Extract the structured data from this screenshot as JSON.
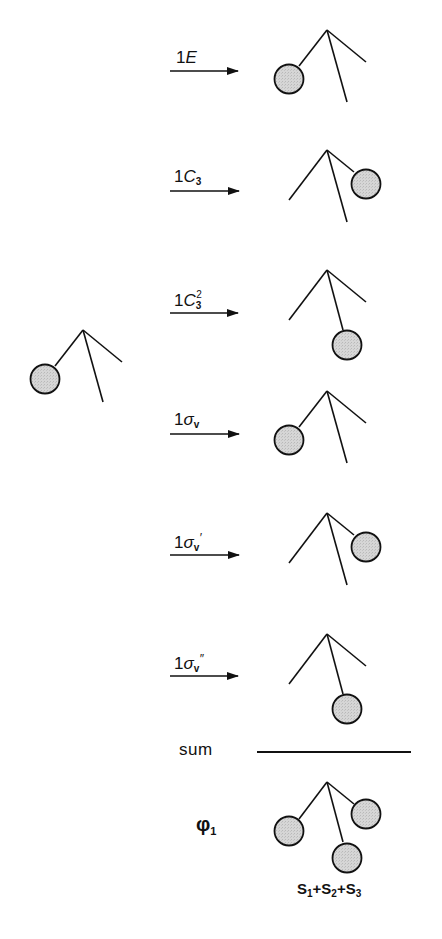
{
  "diagram": {
    "type": "symmetry-projection-operator",
    "colors": {
      "line": "#111111",
      "orbital_fill": "#d2d2d2",
      "background": "#ffffff"
    },
    "start_figure": {
      "label": "",
      "orbital_position": "left"
    },
    "operations": [
      {
        "coefficient": "1",
        "symbol": "E",
        "subscript": "",
        "superscript": "",
        "prime": "",
        "result_orbital_position": "left"
      },
      {
        "coefficient": "1",
        "symbol": "C",
        "subscript": "3",
        "superscript": "",
        "prime": "",
        "result_orbital_position": "right"
      },
      {
        "coefficient": "1",
        "symbol": "C",
        "subscript": "3",
        "superscript": "2",
        "prime": "",
        "result_orbital_position": "bottom"
      },
      {
        "coefficient": "1",
        "symbol": "σ",
        "subscript": "v",
        "superscript": "",
        "prime": "",
        "result_orbital_position": "left"
      },
      {
        "coefficient": "1",
        "symbol": "σ",
        "subscript": "v",
        "superscript": "",
        "prime": "′",
        "result_orbital_position": "right"
      },
      {
        "coefficient": "1",
        "symbol": "σ",
        "subscript": "v",
        "superscript": "",
        "prime": "″",
        "result_orbital_position": "bottom"
      }
    ],
    "sum_label": "sum",
    "result": {
      "symbol": "φ",
      "subscript": "1",
      "orbital_positions": [
        "left",
        "right",
        "bottom"
      ],
      "combination": {
        "terms": [
          {
            "name": "S",
            "sub": "1"
          },
          {
            "name": "S",
            "sub": "2"
          },
          {
            "name": "S",
            "sub": "3"
          }
        ],
        "operator": "+"
      }
    }
  }
}
